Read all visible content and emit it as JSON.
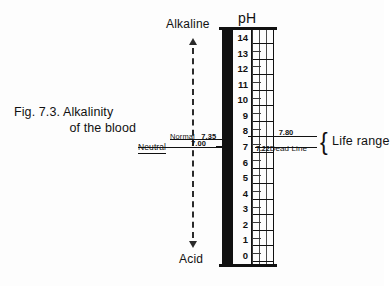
{
  "figure": {
    "caption_line1": "Fig. 7.3. Alkalinity",
    "caption_line2": "of the blood",
    "scale_title": "pH"
  },
  "poles": {
    "top_label": "Alkaline",
    "bottom_label": "Acid",
    "up_arrow_icon": "arrow-up-icon",
    "down_arrow_icon": "arrow-down-icon"
  },
  "scale": {
    "ticks": [
      14,
      13,
      12,
      11,
      10,
      9,
      8,
      7,
      6,
      5,
      4,
      3,
      2,
      1,
      0
    ],
    "min": 0,
    "max": 14,
    "bar_color": "#111111"
  },
  "neutral_marker": {
    "label": "Neutral",
    "value": "7.00"
  },
  "normal_marker": {
    "label": "Normal",
    "value": "7.35"
  },
  "deadline_marker": {
    "upper_value": "7.80",
    "lower_value": "7.22",
    "label": "Dead Line"
  },
  "life_range": {
    "brace_icon": "curly-brace-icon",
    "label": "Life range"
  },
  "chart_data": {
    "type": "bar",
    "title": "pH",
    "ylabel": "pH",
    "ylim": [
      0,
      14
    ],
    "categories": [
      "14",
      "13",
      "12",
      "11",
      "10",
      "9",
      "8",
      "7",
      "6",
      "5",
      "4",
      "3",
      "2",
      "1",
      "0"
    ],
    "values": [
      14,
      13,
      12,
      11,
      10,
      9,
      8,
      7,
      6,
      5,
      4,
      3,
      2,
      1,
      0
    ],
    "annotations": [
      {
        "text": "Alkaline",
        "at": 14,
        "position": "top"
      },
      {
        "text": "Acid",
        "at": 0,
        "position": "bottom"
      },
      {
        "text": "Neutral",
        "at": 7.0
      },
      {
        "text": "Normal 7.35",
        "at": 7.35
      },
      {
        "text": "7.80 Dead Line (upper)",
        "at": 7.8
      },
      {
        "text": "7.22 Dead Line (lower)",
        "at": 7.22
      },
      {
        "text": "Life range",
        "at": [
          7.22,
          7.8
        ]
      }
    ],
    "grid": true,
    "legend": "none"
  }
}
